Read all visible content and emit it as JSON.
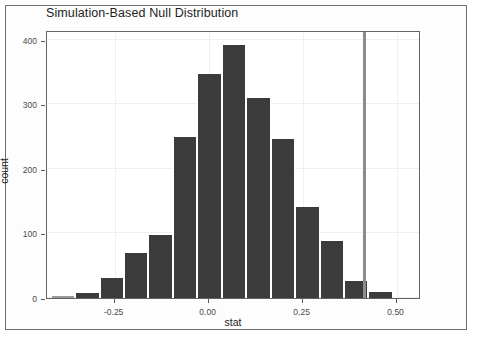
{
  "chart_data": {
    "type": "bar",
    "title": "Simulation-Based Null Distribution",
    "xlabel": "stat",
    "ylabel": "count",
    "xlim": [
      -0.43,
      0.565
    ],
    "ylim": [
      0,
      415
    ],
    "grid": true,
    "legend": "none",
    "bin_width": 0.065,
    "x_ticks": [
      {
        "value": -0.25,
        "label": "-0.25"
      },
      {
        "value": 0.0,
        "label": "0.00"
      },
      {
        "value": 0.25,
        "label": "0.25"
      },
      {
        "value": 0.5,
        "label": "0.50"
      }
    ],
    "y_ticks": [
      {
        "value": 0,
        "label": "0"
      },
      {
        "value": 100,
        "label": "100"
      },
      {
        "value": 200,
        "label": "200"
      },
      {
        "value": 300,
        "label": "300"
      },
      {
        "value": 400,
        "label": "400"
      }
    ],
    "bars": [
      {
        "x_center": -0.3875,
        "value": 3,
        "faint": true
      },
      {
        "x_center": -0.3225,
        "value": 8,
        "faint": false
      },
      {
        "x_center": -0.2575,
        "value": 31,
        "faint": false
      },
      {
        "x_center": -0.1925,
        "value": 70,
        "faint": false
      },
      {
        "x_center": -0.1275,
        "value": 97,
        "faint": false
      },
      {
        "x_center": -0.0625,
        "value": 249,
        "faint": false
      },
      {
        "x_center": 0.0025,
        "value": 347,
        "faint": false
      },
      {
        "x_center": 0.0675,
        "value": 392,
        "faint": false
      },
      {
        "x_center": 0.1325,
        "value": 310,
        "faint": false
      },
      {
        "x_center": 0.1975,
        "value": 247,
        "faint": false
      },
      {
        "x_center": 0.2625,
        "value": 141,
        "faint": false
      },
      {
        "x_center": 0.3275,
        "value": 88,
        "faint": false
      },
      {
        "x_center": 0.3925,
        "value": 27,
        "faint": false
      },
      {
        "x_center": 0.4575,
        "value": 10,
        "faint": false
      }
    ],
    "annotations": [
      {
        "type": "vline",
        "name": "observed-stat-line",
        "value": 0.4125,
        "color": "#8c8c8c"
      }
    ],
    "colors": {
      "bar_fill": "#3b3b3b",
      "bar_faint_fill": "#9a9a9a",
      "panel_background": "#ffffff",
      "grid": "#efefef",
      "axis": "#636363",
      "vline": "#8c8c8c"
    }
  }
}
